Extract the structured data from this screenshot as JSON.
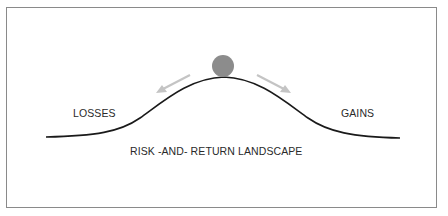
{
  "diagram": {
    "labels": {
      "left": "LOSSES",
      "right": "GAINS",
      "caption": "RISK -AND- RETURN LANDSCAPE"
    },
    "elements": {
      "curve": "bell-shaped hill",
      "ball": "ball balanced at peak",
      "arrows": [
        "arrow pointing down-left toward losses",
        "arrow pointing down-right toward gains"
      ]
    },
    "colors": {
      "curve": "#1a1a1a",
      "ball": "#8c8c8c",
      "arrows": "#c4c4c4",
      "frame": "#8a8a8a",
      "text": "#2a2a2a"
    }
  }
}
